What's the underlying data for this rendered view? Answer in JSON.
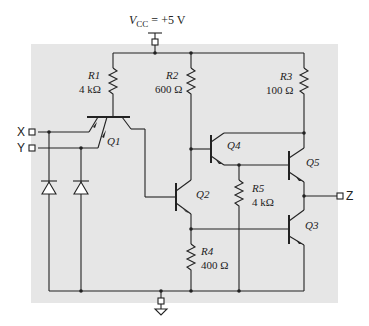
{
  "supply": {
    "label_prefix": "V",
    "label_sub": "CC",
    "label_value": "= +5 V"
  },
  "inputs": [
    {
      "name": "X"
    },
    {
      "name": "Y"
    }
  ],
  "outputs": [
    {
      "name": "Z"
    }
  ],
  "transistors": [
    {
      "id": "Q1"
    },
    {
      "id": "Q2"
    },
    {
      "id": "Q3"
    },
    {
      "id": "Q4"
    },
    {
      "id": "Q5"
    }
  ],
  "resistors": [
    {
      "id": "R1",
      "value": "4 kΩ"
    },
    {
      "id": "R2",
      "value": "600 Ω"
    },
    {
      "id": "R3",
      "value": "100 Ω"
    },
    {
      "id": "R4",
      "value": "400 Ω"
    },
    {
      "id": "R5",
      "value": "4 kΩ"
    }
  ],
  "colors": {
    "background_panel": "#e6e6e6",
    "wire": "#222222",
    "page": "#ffffff"
  }
}
